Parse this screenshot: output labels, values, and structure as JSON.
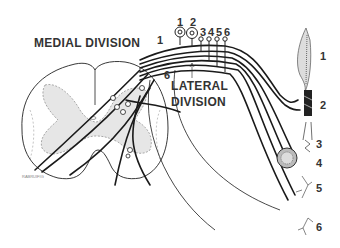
{
  "labels": {
    "medial_division": "MEDIAL DIVISION",
    "lateral_division_line1": "LATERAL",
    "lateral_division_line2": "DIVISION",
    "figure_code": "RABRUIFIG"
  },
  "root_numbers": [
    "1",
    "2",
    "3",
    "4",
    "5",
    "6"
  ],
  "fiber_numbers": [
    "6",
    "1"
  ],
  "receptors": [
    {
      "number": "1",
      "name": "muscle-spindle"
    },
    {
      "number": "2",
      "name": "tendon-organ"
    },
    {
      "number": "3",
      "name": "hair-follicle-receptor"
    },
    {
      "number": "4",
      "name": "pacinian-corpuscle"
    },
    {
      "number": "5",
      "name": "free-nerve-ending"
    },
    {
      "number": "6",
      "name": "free-nerve-ending-fine"
    }
  ],
  "colors": {
    "line": "#1a1a1a",
    "gray_matter": "#e6e6e6",
    "text": "#333333"
  }
}
